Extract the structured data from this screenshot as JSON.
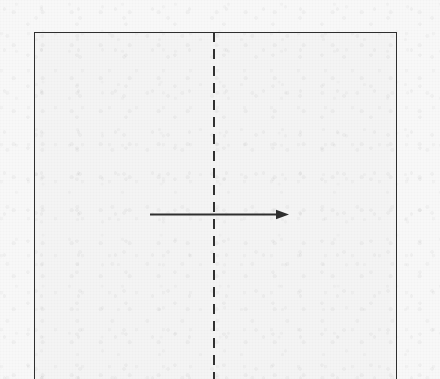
{
  "figure": {
    "caption": "",
    "background_color": "#f8f8f8",
    "ink_color": "#2e2e2e",
    "canvas": {
      "width": 440,
      "height": 379
    },
    "region": {
      "label": "",
      "left": 34,
      "top": 32,
      "right": 397,
      "bottom_cropped": true,
      "border_style": "solid",
      "border_color": "#2e2e2e"
    },
    "divider": {
      "label": "",
      "orientation": "vertical",
      "x": 214,
      "style": "dashed",
      "dash_length": 10,
      "gap_length": 7,
      "color": "#303030"
    },
    "arrow": {
      "label": "",
      "orientation": "horizontal",
      "direction": "right",
      "start_x": 150,
      "end_x": 288,
      "y": 214,
      "head_style": "solid-triangle",
      "color": "#2e2e2e"
    }
  }
}
